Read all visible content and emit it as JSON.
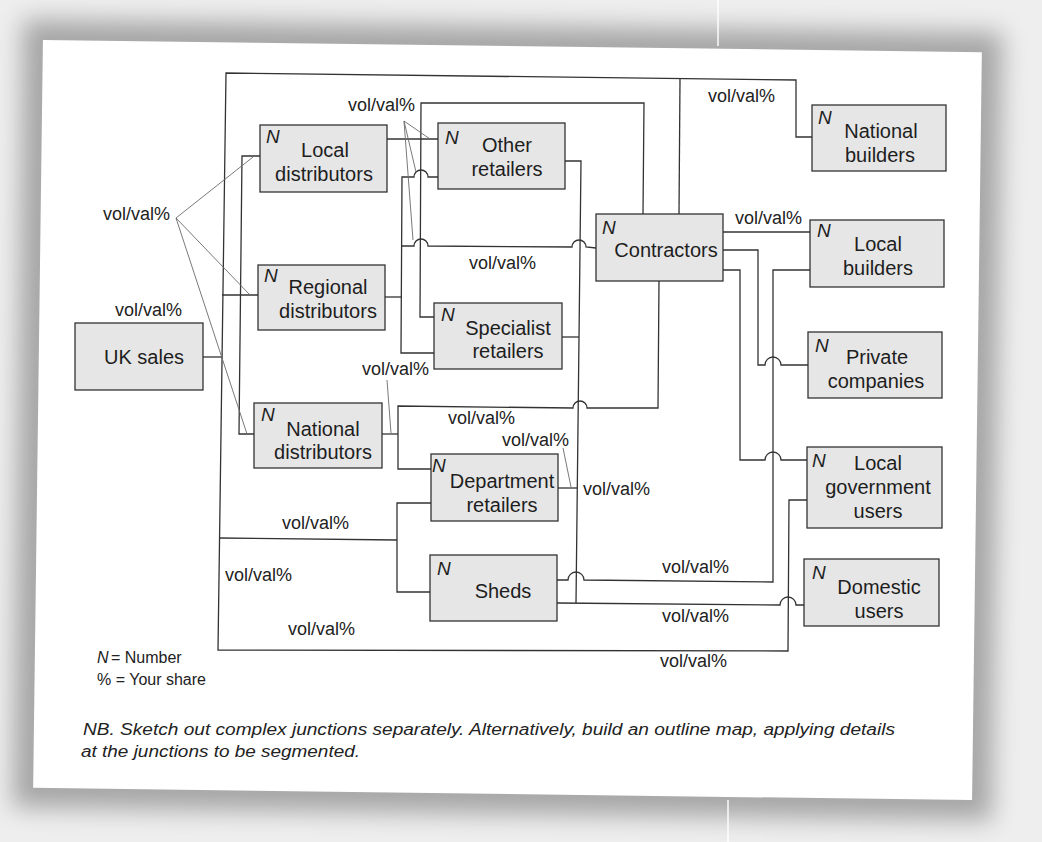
{
  "colors": {
    "box_fill": "#e6e6e6",
    "line": "#333333",
    "background": "#ffffff"
  },
  "diagram": {
    "nodes": {
      "uk_sales": {
        "lines": [
          "UK sales"
        ]
      },
      "local_distributors": {
        "n": "N",
        "lines": [
          "Local",
          "distributors"
        ]
      },
      "regional_distributors": {
        "n": "N",
        "lines": [
          "Regional",
          "distributors"
        ]
      },
      "national_distributors": {
        "n": "N",
        "lines": [
          "National",
          "distributors"
        ]
      },
      "other_retailers": {
        "n": "N",
        "lines": [
          "Other",
          "retailers"
        ]
      },
      "specialist_retailers": {
        "n": "N",
        "lines": [
          "Specialist",
          "retailers"
        ]
      },
      "department_retailers": {
        "n": "N",
        "lines": [
          "Department",
          "retailers"
        ]
      },
      "sheds": {
        "n": "N",
        "lines": [
          "Sheds"
        ]
      },
      "contractors": {
        "n": "N",
        "lines": [
          "Contractors"
        ]
      },
      "national_builders": {
        "n": "N",
        "lines": [
          "National",
          "builders"
        ]
      },
      "local_builders": {
        "n": "N",
        "lines": [
          "Local",
          "builders"
        ]
      },
      "private_companies": {
        "n": "N",
        "lines": [
          "Private",
          "companies"
        ]
      },
      "local_government_users": {
        "n": "N",
        "lines": [
          "Local",
          "government",
          "users"
        ]
      },
      "domestic_users": {
        "n": "N",
        "lines": [
          "Domestic",
          "users"
        ]
      }
    },
    "flow_labels": [
      "vol/val%",
      "vol/val%",
      "vol/val%",
      "vol/val%",
      "vol/val%",
      "vol/val%",
      "vol/val%",
      "vol/val%",
      "vol/val%",
      "vol/val%",
      "vol/val%",
      "vol/val%",
      "vol/val%",
      "vol/val%",
      "vol/val%",
      "vol/val%"
    ]
  },
  "legend": {
    "n_symbol": "N",
    "n_text": "= Number",
    "share_text": "% = Your share"
  },
  "note": {
    "line1": "NB. Sketch out complex junctions separately. Alternatively, build an outline map, applying details",
    "line2": "at the junctions to be segmented."
  }
}
